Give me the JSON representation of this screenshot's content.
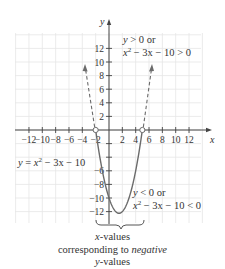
{
  "chart_data": {
    "type": "line",
    "title": "",
    "function": "y = x^2 - 3x - 10",
    "xlabel": "x",
    "ylabel": "y",
    "xlim": [
      -14,
      14
    ],
    "ylim": [
      -14,
      16
    ],
    "grid": true,
    "x_ticks": [
      -12,
      -10,
      -8,
      -6,
      -4,
      -2,
      2,
      4,
      6,
      8,
      10,
      12
    ],
    "x_tick_labels": [
      "−12",
      "−10",
      "−8",
      "−6",
      "−4",
      "−2",
      "2",
      "4",
      "6",
      "8",
      "10",
      "12"
    ],
    "y_ticks": [
      -12,
      -10,
      -8,
      -6,
      -4,
      -2,
      2,
      4,
      6,
      8,
      10,
      12
    ],
    "y_tick_labels_shown": [
      "−12",
      "−10",
      "−8",
      "−6",
      "2",
      "4",
      "6",
      "8",
      "10",
      "12"
    ],
    "roots": [
      -2,
      5
    ],
    "vertex": [
      1.5,
      -12.25
    ],
    "series": [
      {
        "name": "negative region (solid)",
        "style": "solid",
        "x": [
          -2,
          -1,
          0,
          1,
          1.5,
          2,
          3,
          4,
          5
        ],
        "y": [
          0,
          -6,
          -10,
          -12,
          -12.25,
          -12,
          -10,
          -6,
          0
        ]
      },
      {
        "name": "positive region left (dashed)",
        "style": "dashed-arrow",
        "x": [
          -2,
          -2.6
        ],
        "y": [
          0,
          10
        ]
      },
      {
        "name": "positive region right (dashed)",
        "style": "dashed-arrow",
        "x": [
          5,
          5.6
        ],
        "y": [
          0,
          10
        ]
      }
    ],
    "annotations": [
      {
        "text": "y > 0 or",
        "line2": "x² − 3x − 10 > 0",
        "position": "upper right of y-axis"
      },
      {
        "text": "y < 0 or",
        "line2": "x² − 3x − 10 < 0",
        "position": "lower right near vertex"
      },
      {
        "text": "y = x² − 3x − 10",
        "position": "left middle"
      },
      {
        "text": "x-values corresponding to negative y-values",
        "position": "below brace from x=-2 to x=5"
      }
    ],
    "open_circles": [
      [
        -2,
        0
      ],
      [
        5,
        0
      ]
    ]
  },
  "labels": {
    "x_axis": "x",
    "y_axis": "y",
    "equation": "y = x",
    "equation_rest": " − 3x − 10",
    "upper_note_line1": "y > 0 or",
    "upper_note_line2_a": "x",
    "upper_note_line2_b": " − 3x − 10 > 0",
    "lower_note_line1": "y < 0 or",
    "lower_note_line2_a": "x",
    "lower_note_line2_b": " − 3x − 10 < 0",
    "sup2": "2",
    "caption_line1_var": "x",
    "caption_line1_rest": "-values",
    "caption_line2_a": "corresponding to ",
    "caption_line2_b": "negative",
    "caption_line3_var": "y",
    "caption_line3_rest": "-values"
  },
  "colors": {
    "curve": "#6b6b6b",
    "axis": "#444444",
    "grid": "#e6e6e6",
    "text": "#333333"
  }
}
